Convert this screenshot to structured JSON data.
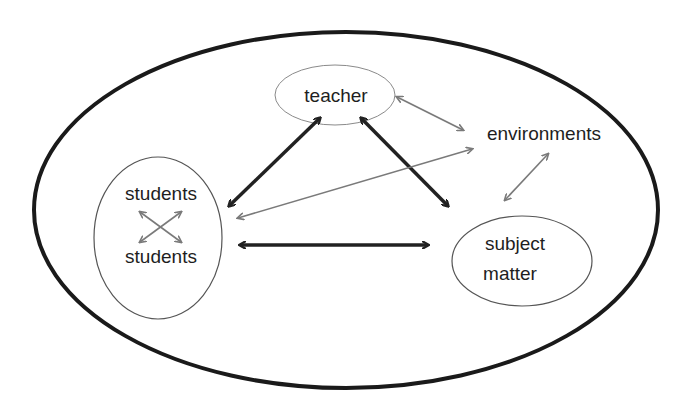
{
  "diagram": {
    "title": "",
    "nodes": {
      "teacher": {
        "label": "teacher"
      },
      "environments": {
        "label": "environments"
      },
      "students": {
        "label_top": "students",
        "label_bottom": "students"
      },
      "subject_matter": {
        "label_line1": "subject",
        "label_line2": "matter"
      }
    },
    "edges": [
      {
        "from": "teacher",
        "to": "students",
        "style": "thick",
        "direction": "bidirectional"
      },
      {
        "from": "teacher",
        "to": "subject_matter",
        "style": "thick",
        "direction": "bidirectional"
      },
      {
        "from": "students",
        "to": "subject_matter",
        "style": "thick",
        "direction": "bidirectional"
      },
      {
        "from": "teacher",
        "to": "environments",
        "style": "thin",
        "direction": "bidirectional"
      },
      {
        "from": "students",
        "to": "environments",
        "style": "thin",
        "direction": "bidirectional"
      },
      {
        "from": "environments",
        "to": "subject_matter",
        "style": "thin",
        "direction": "bidirectional"
      },
      {
        "from": "students",
        "to": "students",
        "style": "thin",
        "direction": "crossed-bidirectional"
      }
    ],
    "colors": {
      "thick": "#222222",
      "thin": "#7a7a7a",
      "outer_border": "#1a1a1a",
      "node_border": "#555555"
    }
  }
}
